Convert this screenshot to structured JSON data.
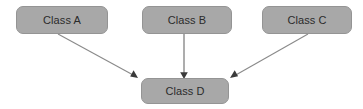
{
  "diagram": {
    "type": "directed-graph",
    "colors": {
      "node_fill": "#a8a8a8",
      "node_border": "#949494",
      "node_text": "#2b2b2b",
      "edge": "#8a8a8a",
      "arrowhead": "#3a3a3a",
      "background": "#ffffff"
    },
    "nodes": [
      {
        "id": "class-a",
        "label": "Class A",
        "x": 16,
        "y": 6,
        "width": 92,
        "height": 28
      },
      {
        "id": "class-b",
        "label": "Class B",
        "x": 142,
        "y": 6,
        "width": 90,
        "height": 28
      },
      {
        "id": "class-c",
        "label": "Class C",
        "x": 262,
        "y": 6,
        "width": 90,
        "height": 28
      },
      {
        "id": "class-d",
        "label": "Class D",
        "x": 141,
        "y": 78,
        "width": 88,
        "height": 26
      }
    ],
    "edges": [
      {
        "id": "edge-a-d",
        "from": "class-a",
        "to": "class-d",
        "x1": 58,
        "y1": 34,
        "x2": 137,
        "y2": 77,
        "arrow": "end"
      },
      {
        "id": "edge-b-d",
        "from": "class-b",
        "to": "class-d",
        "x1": 184,
        "y1": 34,
        "x2": 184,
        "y2": 77,
        "arrow": "end"
      },
      {
        "id": "edge-c-d",
        "from": "class-c",
        "to": "class-d",
        "x1": 308,
        "y1": 34,
        "x2": 231,
        "y2": 77,
        "arrow": "end"
      }
    ]
  }
}
